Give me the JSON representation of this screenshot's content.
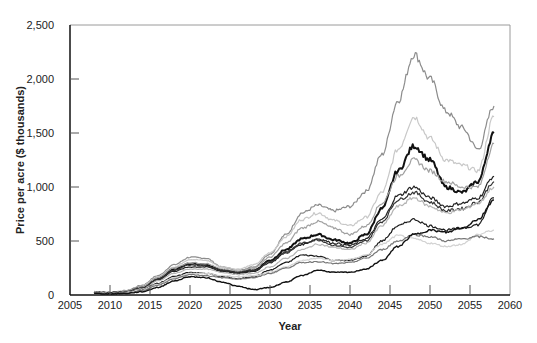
{
  "chart_data": {
    "type": "line",
    "title": "",
    "xlabel": "Year",
    "ylabel": "Price per acre ($ thousands)",
    "xlim": [
      2005,
      2060
    ],
    "ylim": [
      0,
      2500
    ],
    "xticks": [
      2005,
      2010,
      2015,
      2020,
      2025,
      2030,
      2035,
      2040,
      2045,
      2050,
      2055,
      2060
    ],
    "xtick_labels": [
      "2005",
      "2010",
      "2015",
      "2020",
      "2025",
      "2030",
      "2035",
      "2040",
      "2045",
      "2050",
      "2055",
      "2060"
    ],
    "yticks": [
      0,
      500,
      1000,
      1500,
      2000,
      2500
    ],
    "ytick_labels": [
      "0",
      "500",
      "1,000",
      "1,500",
      "2,000",
      "2,500"
    ],
    "grid": false,
    "legend": null,
    "x": [
      2008,
      2010,
      2012,
      2014,
      2016,
      2018,
      2020,
      2022,
      2024,
      2026,
      2028,
      2030,
      2032,
      2034,
      2036,
      2038,
      2040,
      2042,
      2044,
      2046,
      2048,
      2050,
      2052,
      2054,
      2056,
      2058
    ],
    "series": [
      {
        "name": "Path 1",
        "color": "#8c8c8c",
        "width": 1.2,
        "values": [
          30,
          25,
          40,
          90,
          180,
          280,
          350,
          340,
          260,
          230,
          260,
          380,
          560,
          760,
          830,
          780,
          820,
          960,
          1300,
          1800,
          2230,
          2000,
          1700,
          1550,
          1350,
          1750
        ]
      },
      {
        "name": "Path 2",
        "color": "#c8c8c8",
        "width": 1.2,
        "values": [
          25,
          20,
          35,
          80,
          170,
          260,
          330,
          320,
          260,
          240,
          280,
          390,
          540,
          700,
          760,
          690,
          640,
          720,
          950,
          1350,
          1650,
          1450,
          1250,
          1200,
          1150,
          1650
        ]
      },
      {
        "name": "Path 3",
        "color": "#111111",
        "width": 2.0,
        "values": [
          25,
          20,
          30,
          70,
          150,
          240,
          290,
          280,
          230,
          210,
          230,
          320,
          420,
          520,
          560,
          510,
          480,
          560,
          800,
          1150,
          1380,
          1250,
          1000,
          950,
          1050,
          1500
        ]
      },
      {
        "name": "Path 4",
        "color": "#a0a0a0",
        "width": 1.2,
        "values": [
          30,
          22,
          35,
          75,
          160,
          250,
          300,
          290,
          240,
          220,
          250,
          350,
          480,
          620,
          680,
          620,
          560,
          640,
          850,
          1100,
          1250,
          1150,
          1050,
          1000,
          1000,
          1400
        ]
      },
      {
        "name": "Path 5",
        "color": "#222222",
        "width": 1.2,
        "values": [
          20,
          18,
          28,
          60,
          140,
          220,
          260,
          260,
          220,
          200,
          220,
          300,
          390,
          470,
          520,
          480,
          460,
          520,
          700,
          920,
          1000,
          900,
          820,
          850,
          900,
          1100
        ]
      },
      {
        "name": "Path 6",
        "color": "#333333",
        "width": 1.2,
        "values": [
          22,
          18,
          30,
          65,
          145,
          230,
          280,
          270,
          230,
          210,
          230,
          310,
          400,
          480,
          510,
          460,
          440,
          500,
          680,
          880,
          950,
          860,
          780,
          800,
          860,
          1050
        ]
      },
      {
        "name": "Path 7",
        "color": "#b4b4b4",
        "width": 1.2,
        "values": [
          20,
          15,
          25,
          55,
          130,
          200,
          240,
          240,
          210,
          190,
          200,
          260,
          340,
          420,
          470,
          440,
          420,
          480,
          640,
          820,
          900,
          820,
          760,
          790,
          850,
          1000
        ]
      },
      {
        "name": "Path 8",
        "color": "#1a1a1a",
        "width": 1.2,
        "values": [
          18,
          15,
          22,
          45,
          110,
          170,
          210,
          200,
          170,
          150,
          170,
          230,
          300,
          370,
          360,
          320,
          320,
          360,
          500,
          640,
          700,
          640,
          600,
          620,
          650,
          900
        ]
      },
      {
        "name": "Path 9",
        "color": "#d2d2d2",
        "width": 1.2,
        "values": [
          20,
          15,
          22,
          45,
          100,
          160,
          200,
          200,
          180,
          170,
          180,
          210,
          260,
          320,
          340,
          320,
          330,
          370,
          470,
          550,
          520,
          480,
          450,
          470,
          560,
          600
        ]
      },
      {
        "name": "Path 10",
        "color": "#777777",
        "width": 1.2,
        "values": [
          18,
          12,
          20,
          40,
          90,
          150,
          190,
          180,
          160,
          150,
          160,
          200,
          250,
          300,
          310,
          290,
          300,
          340,
          420,
          500,
          560,
          540,
          500,
          520,
          540,
          520
        ]
      },
      {
        "name": "Path 11",
        "color": "#111111",
        "width": 1.4,
        "values": [
          15,
          10,
          15,
          30,
          70,
          130,
          170,
          160,
          120,
          80,
          50,
          70,
          120,
          180,
          230,
          210,
          210,
          240,
          320,
          450,
          560,
          600,
          580,
          620,
          700,
          880
        ]
      }
    ]
  }
}
